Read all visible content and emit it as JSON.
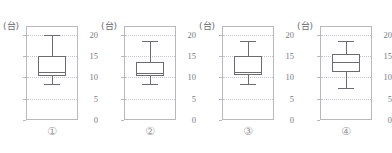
{
  "top_cut_text": "                                                                                                  ",
  "axis": {
    "unit_label": "(台)",
    "ticks": [
      0,
      5,
      10,
      15,
      20
    ],
    "ymin": 0,
    "ymax": 22
  },
  "chart_data": [
    {
      "type": "box",
      "id": "1",
      "caption": "①",
      "ylabel": "(台)",
      "ylim": [
        0,
        22
      ],
      "yticks": [
        0,
        5,
        10,
        15,
        20
      ],
      "grid": true,
      "min": 8.5,
      "q1": 10.3,
      "median": 11.2,
      "q3": 15.0,
      "max": 20.0
    },
    {
      "type": "box",
      "id": "2",
      "caption": "②",
      "ylabel": "(台)",
      "ylim": [
        0,
        22
      ],
      "yticks": [
        0,
        5,
        10,
        15,
        20
      ],
      "grid": true,
      "min": 8.5,
      "q1": 10.2,
      "median": 11.0,
      "q3": 13.5,
      "max": 18.5
    },
    {
      "type": "box",
      "id": "3",
      "caption": "③",
      "ylabel": "(台)",
      "ylim": [
        0,
        22
      ],
      "yticks": [
        0,
        5,
        10,
        15,
        20
      ],
      "grid": true,
      "min": 8.5,
      "q1": 10.5,
      "median": 11.2,
      "q3": 15.0,
      "max": 18.5
    },
    {
      "type": "box",
      "id": "4",
      "caption": "④",
      "ylabel": "(台)",
      "ylim": [
        0,
        22
      ],
      "yticks": [
        0,
        5,
        10,
        15,
        20
      ],
      "grid": true,
      "min": 7.5,
      "q1": 11.2,
      "median": 13.5,
      "q3": 15.5,
      "max": 18.5
    }
  ],
  "panel_left_positions": [
    0,
    98,
    196,
    294
  ]
}
